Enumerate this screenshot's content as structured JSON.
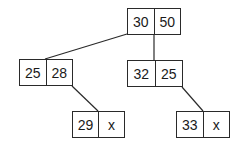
{
  "diagram": {
    "type": "tree",
    "colors": {
      "stroke": "#2a2a2a",
      "text": "#1a1a1a",
      "background": "#ffffff"
    },
    "nodes": [
      {
        "id": "root",
        "keys": [
          "30",
          "50"
        ],
        "box": {
          "x": 127,
          "y": 8,
          "w": 54,
          "h": 27
        }
      },
      {
        "id": "left",
        "keys": [
          "25",
          "28"
        ],
        "box": {
          "x": 19,
          "y": 59,
          "w": 54,
          "h": 27
        }
      },
      {
        "id": "middle",
        "keys": [
          "32",
          "25"
        ],
        "box": {
          "x": 127,
          "y": 60,
          "w": 56,
          "h": 27
        }
      },
      {
        "id": "left-child",
        "keys": [
          "29",
          "x"
        ],
        "box": {
          "x": 72,
          "y": 111,
          "w": 53,
          "h": 27
        }
      },
      {
        "id": "middle-child",
        "keys": [
          "33",
          "x"
        ],
        "box": {
          "x": 176,
          "y": 111,
          "w": 54,
          "h": 27
        }
      }
    ],
    "edges": [
      {
        "from": "root",
        "to": "left",
        "x1": 127,
        "y1": 34,
        "x2": 45,
        "y2": 59
      },
      {
        "from": "root",
        "to": "middle",
        "x1": 154,
        "y1": 34,
        "x2": 154,
        "y2": 60
      },
      {
        "from": "left",
        "to": "left-child",
        "x1": 72,
        "y1": 86,
        "x2": 98,
        "y2": 111
      },
      {
        "from": "middle",
        "to": "middle-child",
        "x1": 182,
        "y1": 87,
        "x2": 203,
        "y2": 111
      }
    ]
  }
}
